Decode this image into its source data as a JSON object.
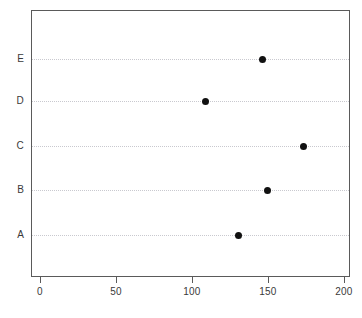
{
  "chart_data": {
    "type": "scatter",
    "plot_style": "dot-chart",
    "title": "",
    "xlabel": "",
    "ylabel": "",
    "categories": [
      "A",
      "B",
      "C",
      "D",
      "E"
    ],
    "values": [
      130,
      149,
      173,
      108,
      146
    ],
    "points": [
      {
        "category": "A",
        "value": 130
      },
      {
        "category": "B",
        "value": 149
      },
      {
        "category": "C",
        "value": 173
      },
      {
        "category": "D",
        "value": 108
      },
      {
        "category": "E",
        "value": 146
      }
    ],
    "xlim": [
      0,
      200
    ],
    "xticks": [
      0,
      50,
      100,
      150,
      200
    ],
    "xtick_labels": [
      "0",
      "50",
      "100",
      "150",
      "200"
    ],
    "ytick_labels": [
      "A",
      "B",
      "C",
      "D",
      "E"
    ],
    "grid": true,
    "grid_orientation": "horizontal",
    "grid_style": "dotted",
    "legend": false,
    "legend_position": "none",
    "marker": "filled-circle",
    "colors": {
      "marker": "#111111",
      "grid": "#c9c9cf",
      "panel_border": "#5a5a5a",
      "axis_text": "#3a3a3a",
      "background": "#ffffff"
    }
  }
}
